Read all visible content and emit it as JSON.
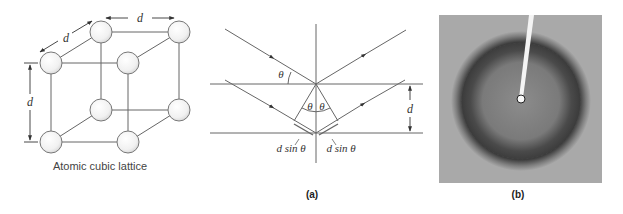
{
  "lattice": {
    "caption": "Atomic cubic lattice",
    "dim_top": "d",
    "dim_diag": "d",
    "dim_left": "d"
  },
  "bragg": {
    "theta_outer": "θ",
    "theta_left": "θ",
    "theta_right": "θ",
    "spacing": "d",
    "path_left": "d sin θ",
    "path_right": "d sin θ"
  },
  "panels": {
    "a_label": "(a)",
    "b_label": "(b)"
  },
  "photo": {
    "description": "X-ray diffraction pattern with dark ring around central beam stop",
    "background_color": "#a9a9a9",
    "ring_color": "#3e3e3e"
  }
}
